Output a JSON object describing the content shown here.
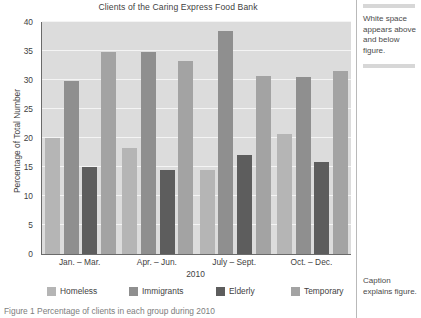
{
  "figure": {
    "title": "Clients of the Caring Express Food Bank",
    "caption": "Figure 1  Percentage of clients in each group during 2010"
  },
  "annotations": {
    "top": "White space appears above and below figure.",
    "bottom": "Caption explains figure."
  },
  "colors": {
    "plot_background": "#dcdcdc",
    "gridline": "#f4f4f4",
    "axis": "#6a6a6a",
    "homeless": "#b5b5b5",
    "immigrants": "#8f8f8f",
    "elderly": "#5d5d5d",
    "temporary": "#a3a3a3"
  },
  "chart_data": {
    "type": "bar",
    "title": "Clients of the Caring Express Food Bank",
    "xlabel": "2010",
    "ylabel": "Percentage of Total Number",
    "ylim": [
      0,
      40
    ],
    "yticks": [
      0,
      5,
      10,
      15,
      20,
      25,
      30,
      35,
      40
    ],
    "ytick_labels": [
      "0",
      "5",
      "10",
      "15",
      "20",
      "25",
      "30",
      "35",
      "40"
    ],
    "grid": true,
    "legend_position": "bottom",
    "categories": [
      "Jan. – Mar.",
      "Apr. – Jun.",
      "July – Sept.",
      "Oct. – Dec."
    ],
    "series": [
      {
        "name": "Homeless",
        "color": "#b5b5b5",
        "values": [
          20.0,
          18.3,
          14.5,
          20.7
        ]
      },
      {
        "name": "Immigrants",
        "color": "#8f8f8f",
        "values": [
          29.9,
          34.8,
          38.5,
          30.6
        ]
      },
      {
        "name": "Elderly",
        "color": "#5d5d5d",
        "values": [
          15.0,
          14.5,
          17.0,
          15.8
        ]
      },
      {
        "name": "Temporary",
        "color": "#a3a3a3",
        "values": [
          34.9,
          33.3,
          30.7,
          31.6
        ]
      }
    ]
  }
}
